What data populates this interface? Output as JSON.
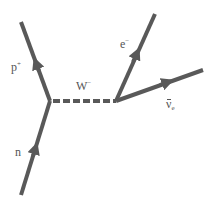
{
  "diagram": {
    "type": "feynman-diagram",
    "line_color": "#595959",
    "label_color": "#555555",
    "vertices": [
      {
        "id": "v1",
        "x": 50,
        "y": 101
      },
      {
        "id": "v2",
        "x": 116,
        "y": 101
      }
    ],
    "particles": [
      {
        "id": "neutron",
        "label": "n",
        "charge": "",
        "type": "fermion",
        "from": [
          21,
          195
        ],
        "to": [
          50,
          101
        ]
      },
      {
        "id": "proton",
        "label": "p",
        "charge": "+",
        "type": "fermion",
        "from": [
          50,
          101
        ],
        "to": [
          21,
          22
        ]
      },
      {
        "id": "w-boson",
        "label": "W",
        "charge": "−",
        "type": "boson-dashed",
        "from": [
          50,
          101
        ],
        "to": [
          116,
          101
        ]
      },
      {
        "id": "electron",
        "label": "e",
        "charge": "−",
        "type": "fermion",
        "from": [
          116,
          101
        ],
        "to": [
          155,
          14
        ]
      },
      {
        "id": "antineutrino",
        "label": "ν",
        "subscript": "e",
        "type": "antifermion",
        "from": [
          116,
          101
        ],
        "to": [
          203,
          70
        ]
      }
    ]
  }
}
